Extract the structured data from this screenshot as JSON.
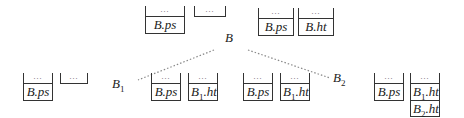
{
  "diagram": {
    "nodes": [
      {
        "id": "B",
        "label": "B"
      },
      {
        "id": "B1",
        "label": "B",
        "sub": "1"
      },
      {
        "id": "B2",
        "label": "B",
        "sub": "2"
      }
    ],
    "ellipsis": "...",
    "states": {
      "B": {
        "left_stack": [
          "B.ps"
        ],
        "left_empty": true,
        "right_stacks": [
          [
            "B.ps"
          ],
          [
            "B.ht"
          ]
        ]
      },
      "B1": {
        "left_stack": [
          "B.ps"
        ],
        "left_empty": true,
        "right_stacks": [
          [
            "B.ps"
          ],
          [
            "B1.ht"
          ]
        ]
      },
      "B2": {
        "left_stack": [
          "B.ps"
        ],
        "left_stack_2": [
          "B1.ht"
        ],
        "right_stacks": [
          [
            "B.ps"
          ],
          [
            "B1.ht",
            "B2.ht"
          ]
        ]
      }
    },
    "cells": {
      "b_ps": "B.ps",
      "b_ht": "B.ht",
      "b_pre": "B",
      "ps": ".ps",
      "ht": ".ht",
      "sub1": "1",
      "sub2": "2"
    },
    "edges": [
      [
        "B",
        "B1"
      ],
      [
        "B",
        "B2"
      ]
    ]
  }
}
